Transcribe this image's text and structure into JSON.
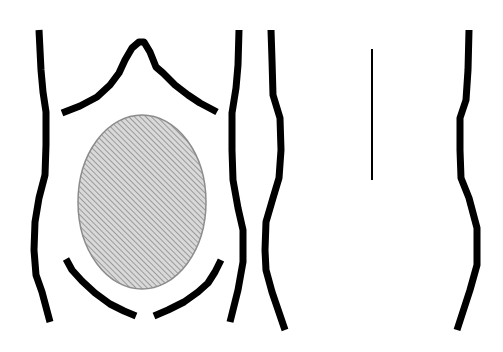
{
  "diagram": {
    "colors": {
      "background": "#ffffff",
      "outline": "#000000",
      "hatch_fill": "#d9d9d9",
      "hatch_line": "#8a8a8a",
      "ellipse_border": "#8c8c8c"
    },
    "left_figure": {
      "outline_stroke_width": 7,
      "left_side": [
        [
          39,
          30
        ],
        [
          41,
          70
        ],
        [
          43,
          92
        ],
        [
          46,
          112
        ],
        [
          46,
          145
        ],
        [
          45,
          175
        ],
        [
          39,
          198
        ],
        [
          35,
          222
        ],
        [
          34,
          250
        ],
        [
          36,
          275
        ],
        [
          42,
          292
        ],
        [
          50,
          322
        ]
      ],
      "right_side": [
        [
          239,
          30
        ],
        [
          238,
          65
        ],
        [
          236,
          88
        ],
        [
          232,
          113
        ],
        [
          232,
          150
        ],
        [
          233,
          180
        ],
        [
          238,
          208
        ],
        [
          243,
          230
        ],
        [
          243,
          262
        ],
        [
          238,
          290
        ],
        [
          230,
          322
        ]
      ],
      "rib_arch": [
        [
          62,
          113
        ],
        [
          80,
          106
        ],
        [
          97,
          97
        ],
        [
          110,
          85
        ],
        [
          119,
          73
        ],
        [
          125,
          60
        ],
        [
          132,
          48
        ],
        [
          139,
          42
        ],
        [
          144,
          42
        ],
        [
          150,
          52
        ],
        [
          156,
          67
        ],
        [
          163,
          73
        ],
        [
          175,
          85
        ],
        [
          188,
          95
        ],
        [
          200,
          103
        ],
        [
          217,
          112
        ]
      ],
      "groin_left": [
        [
          66,
          259
        ],
        [
          72,
          270
        ],
        [
          82,
          281
        ],
        [
          95,
          293
        ],
        [
          110,
          304
        ],
        [
          124,
          311
        ],
        [
          136,
          316
        ]
      ],
      "groin_right": [
        [
          154,
          316
        ],
        [
          168,
          310
        ],
        [
          184,
          302
        ],
        [
          198,
          292
        ],
        [
          208,
          283
        ],
        [
          215,
          272
        ],
        [
          221,
          260
        ]
      ],
      "hatched_region": {
        "cx": 142,
        "cy": 202,
        "rx": 64,
        "ry": 87
      }
    },
    "right_figure": {
      "outline_stroke_width": 7,
      "left_side": [
        [
          271,
          30
        ],
        [
          272,
          60
        ],
        [
          273,
          95
        ],
        [
          280,
          118
        ],
        [
          281,
          150
        ],
        [
          279,
          178
        ],
        [
          273,
          198
        ],
        [
          266,
          222
        ],
        [
          265,
          250
        ],
        [
          266,
          270
        ],
        [
          272,
          292
        ],
        [
          285,
          330
        ]
      ],
      "right_side": [
        [
          469,
          30
        ],
        [
          468,
          70
        ],
        [
          466,
          100
        ],
        [
          460,
          118
        ],
        [
          460,
          150
        ],
        [
          461,
          178
        ],
        [
          469,
          198
        ],
        [
          477,
          228
        ],
        [
          477,
          265
        ],
        [
          470,
          290
        ],
        [
          457,
          330
        ]
      ],
      "midline": {
        "x": 372,
        "y1": 49,
        "y2": 180,
        "stroke_width": 2
      }
    }
  }
}
